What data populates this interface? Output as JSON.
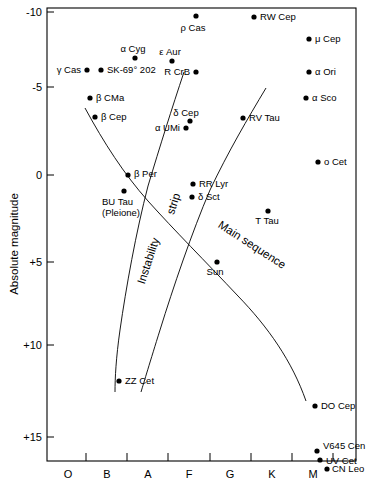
{
  "chart_data": {
    "type": "scatter",
    "title": "",
    "xlabel": "",
    "ylabel": "Absolute magnitude",
    "x_axis": {
      "name": "spectral-class",
      "tick_labels": [
        "O",
        "B",
        "A",
        "F",
        "G",
        "K",
        "M"
      ],
      "tick_positions_px": [
        86,
        127,
        168,
        210,
        251,
        292,
        333
      ],
      "label_positions_px": [
        68,
        107,
        148,
        189,
        230,
        272,
        313
      ]
    },
    "y_axis": {
      "name": "absolute-magnitude",
      "tick_labels": [
        "-10",
        "-5",
        "0",
        "+5",
        "+10",
        "+15"
      ],
      "tick_values": [
        -10,
        -5,
        0,
        5,
        10,
        15
      ],
      "tick_positions_px": [
        12,
        87,
        175,
        262,
        345,
        437
      ],
      "ylim": [
        -10.8,
        16.5
      ],
      "direction": "inverted"
    },
    "grid": false,
    "legend": null,
    "points": [
      {
        "label": "ρ Cas",
        "x_px": 196,
        "y_px": 16,
        "label_dx": -3,
        "label_dy": 15,
        "anchor": "middle"
      },
      {
        "label": "RW Cep",
        "x_px": 254,
        "y_px": 17,
        "label_dx": 6,
        "label_dy": 3,
        "anchor": "start"
      },
      {
        "label": "μ Cep",
        "x_px": 309,
        "y_px": 39,
        "label_dx": 6,
        "label_dy": 3,
        "anchor": "start"
      },
      {
        "label": "α Cyg",
        "x_px": 135,
        "y_px": 58,
        "label_dx": -2,
        "label_dy": -6,
        "anchor": "middle"
      },
      {
        "label": "ε Aur",
        "x_px": 172,
        "y_px": 61,
        "label_dx": -2,
        "label_dy": -6,
        "anchor": "middle"
      },
      {
        "label": "γ Cas",
        "x_px": 87,
        "y_px": 70,
        "label_dx": -6,
        "label_dy": 3,
        "anchor": "end"
      },
      {
        "label": "SK-69° 202",
        "x_px": 101,
        "y_px": 70,
        "label_dx": 6,
        "label_dy": 3,
        "anchor": "start"
      },
      {
        "label": "R CrB",
        "x_px": 196,
        "y_px": 72,
        "label_dx": -6,
        "label_dy": 3,
        "anchor": "end"
      },
      {
        "label": "α Ori",
        "x_px": 309,
        "y_px": 72,
        "label_dx": 6,
        "label_dy": 3,
        "anchor": "start"
      },
      {
        "label": "α Sco",
        "x_px": 306,
        "y_px": 98,
        "label_dx": 6,
        "label_dy": 3,
        "anchor": "start"
      },
      {
        "label": "β CMa",
        "x_px": 90,
        "y_px": 98,
        "label_dx": 6,
        "label_dy": 3,
        "anchor": "start"
      },
      {
        "label": "δ Cep",
        "x_px": 190,
        "y_px": 121,
        "label_dx": -4,
        "label_dy": -5,
        "anchor": "middle"
      },
      {
        "label": "β Cep",
        "x_px": 95,
        "y_px": 117,
        "label_dx": 6,
        "label_dy": 3,
        "anchor": "start"
      },
      {
        "label": "RV Tau",
        "x_px": 243,
        "y_px": 118,
        "label_dx": 6,
        "label_dy": 3,
        "anchor": "start"
      },
      {
        "label": "α UMi",
        "x_px": 186,
        "y_px": 128,
        "label_dx": -6,
        "label_dy": 3,
        "anchor": "end"
      },
      {
        "label": "o Cet",
        "x_px": 318,
        "y_px": 162,
        "label_dx": 6,
        "label_dy": 3,
        "anchor": "start"
      },
      {
        "label": "β Per",
        "x_px": 128,
        "y_px": 175,
        "label_dx": 6,
        "label_dy": 2,
        "anchor": "start"
      },
      {
        "label": "RR Lyr",
        "x_px": 193,
        "y_px": 184,
        "label_dx": 6,
        "label_dy": 3,
        "anchor": "start"
      },
      {
        "label": "δ Sct",
        "x_px": 192,
        "y_px": 197,
        "label_dx": 6,
        "label_dy": 3,
        "anchor": "start"
      },
      {
        "label": "BU Tau\n(Pleione)",
        "x_px": 124,
        "y_px": 191,
        "label_dx": -22,
        "label_dy": 14,
        "anchor": "start"
      },
      {
        "label": "T Tau",
        "x_px": 268,
        "y_px": 211,
        "label_dx": -1,
        "label_dy": 13,
        "anchor": "middle"
      },
      {
        "label": "Sun",
        "x_px": 217,
        "y_px": 262,
        "label_dx": -2,
        "label_dy": 13,
        "anchor": "middle"
      },
      {
        "label": "ZZ Cet",
        "x_px": 119,
        "y_px": 381,
        "label_dx": 6,
        "label_dy": 3,
        "anchor": "start"
      },
      {
        "label": "DO Cep",
        "x_px": 315,
        "y_px": 406,
        "label_dx": 6,
        "label_dy": 3,
        "anchor": "start"
      },
      {
        "label": "V645 Cen",
        "x_px": 317,
        "y_px": 451,
        "label_dx": 6,
        "label_dy": -2,
        "anchor": "start"
      },
      {
        "label": "UV Cet",
        "x_px": 320,
        "y_px": 460,
        "label_dx": 6,
        "label_dy": 4,
        "anchor": "start"
      },
      {
        "label": "CN Leo",
        "x_px": 327,
        "y_px": 469,
        "label_dx": 5,
        "label_dy": 3,
        "anchor": "start"
      }
    ],
    "annotations": [
      {
        "name": "instability-strip",
        "text": "Instability",
        "x_px": 152,
        "y_px": 262,
        "rotation": -72
      },
      {
        "name": "instability-strip-word2",
        "text": "strip",
        "x_px": 177,
        "y_px": 205,
        "rotation": -72
      },
      {
        "name": "main-sequence",
        "text": "Main sequence",
        "x_px": 250,
        "y_px": 248,
        "rotation": 33
      }
    ],
    "curves": [
      {
        "name": "main-sequence-curve",
        "path": "M 85,108 C 104,143 124,174 148,201 C 174,230 206,262 238,296 C 268,327 292,361 306,401"
      },
      {
        "name": "instability-strip-left-edge",
        "path": "M 184,72 C 172,108 160,146 148,186 C 136,232 126,288 120,330 C 116,358 115,378 115,392"
      },
      {
        "name": "instability-strip-right-edge",
        "path": "M 266,88 C 248,118 228,152 210,190 C 192,232 173,288 160,330 C 150,362 144,382 141,392"
      }
    ]
  },
  "axis_titles": {
    "y": "Absolute magnitude"
  }
}
